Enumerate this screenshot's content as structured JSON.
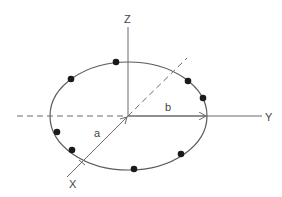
{
  "diagram": {
    "type": "3d-axes-ellipse",
    "axes": {
      "z_label": "Z",
      "y_label": "Y",
      "x_label": "X"
    },
    "semi_axes": {
      "a_label": "a",
      "b_label": "b"
    },
    "points_on_ellipse": 8,
    "colors": {
      "line": "#6a6a6a",
      "dot": "#1a1a1a",
      "background": "#ffffff"
    }
  }
}
